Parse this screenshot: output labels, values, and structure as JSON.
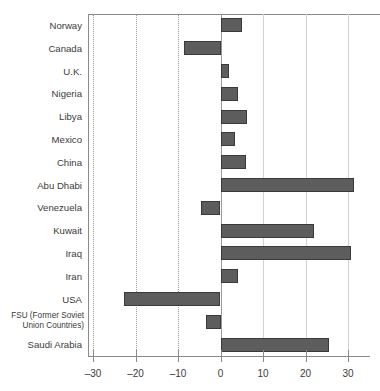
{
  "chart_data": {
    "type": "bar",
    "orientation": "horizontal",
    "title": "",
    "xlabel": "",
    "ylabel": "",
    "xlim": [
      -32,
      34
    ],
    "xticks": [
      -30,
      -20,
      -10,
      0,
      10,
      20,
      30
    ],
    "xtick_labels": [
      "–30",
      "–20",
      "–10",
      "0",
      "10",
      "20",
      "30"
    ],
    "grid": true,
    "grid_axis": "x",
    "legend": "none",
    "bar_color": "#5d5d5d",
    "bar_edge_color": "#3a3a3a",
    "categories": [
      "Norway",
      "Canada",
      "U.K.",
      "Nigeria",
      "Libya",
      "Mexico",
      "China",
      "Abu Dhabi",
      "Venezuela",
      "Kuwait",
      "Iraq",
      "Iran",
      "USA",
      "FSU (Former Soviet Union Countries)",
      "Saudi Arabia"
    ],
    "category_labels": [
      {
        "text": "Norway",
        "lines": [
          "Norway"
        ]
      },
      {
        "text": "Canada",
        "lines": [
          "Canada"
        ]
      },
      {
        "text": "U.K.",
        "lines": [
          "U.K."
        ]
      },
      {
        "text": "Nigeria",
        "lines": [
          "Nigeria"
        ]
      },
      {
        "text": "Libya",
        "lines": [
          "Libya"
        ]
      },
      {
        "text": "Mexico",
        "lines": [
          "Mexico"
        ]
      },
      {
        "text": "China",
        "lines": [
          "China"
        ]
      },
      {
        "text": "Abu Dhabi",
        "lines": [
          "Abu Dhabi"
        ]
      },
      {
        "text": "Venezuela",
        "lines": [
          "Venezuela"
        ]
      },
      {
        "text": "Kuwait",
        "lines": [
          "Kuwait"
        ]
      },
      {
        "text": "Iraq",
        "lines": [
          "Iraq"
        ]
      },
      {
        "text": "Iran",
        "lines": [
          "Iran"
        ]
      },
      {
        "text": "USA",
        "lines": [
          "USA"
        ]
      },
      {
        "text": "FSU (Former Soviet Union Countries)",
        "lines": [
          "FSU (Former Soviet",
          "Union Countries)"
        ]
      },
      {
        "text": "Saudi Arabia",
        "lines": [
          "Saudi Arabia"
        ]
      }
    ],
    "values": [
      5.0,
      -8.5,
      2.0,
      4.2,
      6.3,
      3.5,
      6.1,
      31.5,
      -4.7,
      22.0,
      30.8,
      4.0,
      -22.8,
      -3.5,
      25.6
    ]
  },
  "labels": {
    "norway": "Norway",
    "canada": "Canada",
    "uk": "U.K.",
    "nigeria": "Nigeria",
    "libya": "Libya",
    "mexico": "Mexico",
    "china": "China",
    "abu_dhabi": "Abu Dhabi",
    "venezuela": "Venezuela",
    "kuwait": "Kuwait",
    "iraq": "Iraq",
    "iran": "Iran",
    "usa": "USA",
    "fsu_line1": "FSU (Former Soviet",
    "fsu_line2": "Union Countries)",
    "saudi_arabia": "Saudi Arabia"
  },
  "axis": {
    "tick_minus_30": "–30",
    "tick_minus_20": "–20",
    "tick_minus_10": "–10",
    "tick_0": "0",
    "tick_10": "10",
    "tick_20": "20",
    "tick_30": "30"
  }
}
